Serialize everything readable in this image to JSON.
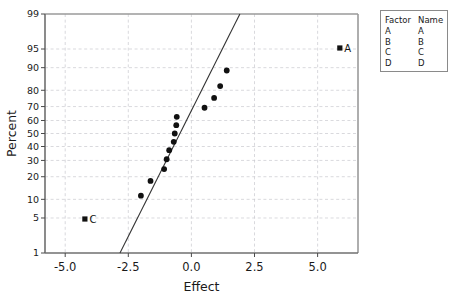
{
  "chart_data": {
    "type": "scatter",
    "title": "",
    "xlabel": "Effect",
    "ylabel": "Percent",
    "xlim": [
      -5.8,
      6.6
    ],
    "ylim": [
      1,
      99
    ],
    "grid": true,
    "yscale": "normal-probability",
    "xticks": [
      -5.0,
      -2.5,
      0.0,
      2.5,
      5.0
    ],
    "xtick_labels": [
      "-5.0",
      "-2.5",
      "0.0",
      "2.5",
      "5.0"
    ],
    "yticks": [
      1,
      5,
      10,
      20,
      30,
      40,
      50,
      60,
      70,
      80,
      90,
      95,
      99
    ],
    "ytick_labels": [
      "1",
      "5",
      "10",
      "20",
      "30",
      "40",
      "50",
      "60",
      "70",
      "80",
      "90",
      "95",
      "99"
    ],
    "series": [
      {
        "name": "Not Significant",
        "marker": "circle",
        "color": "#111111",
        "points": [
          {
            "x": -2.0,
            "y": 11.3
          },
          {
            "x": -1.62,
            "y": 17.8
          },
          {
            "x": -1.08,
            "y": 24.4
          },
          {
            "x": -0.98,
            "y": 30.8
          },
          {
            "x": -0.88,
            "y": 37.3
          },
          {
            "x": -0.7,
            "y": 43.6
          },
          {
            "x": -0.66,
            "y": 50.0
          },
          {
            "x": -0.6,
            "y": 56.4
          },
          {
            "x": -0.58,
            "y": 62.7
          },
          {
            "x": 0.52,
            "y": 69.2
          },
          {
            "x": 0.9,
            "y": 75.6
          },
          {
            "x": 1.14,
            "y": 82.2
          },
          {
            "x": 1.4,
            "y": 89.0
          }
        ]
      },
      {
        "name": "Significant",
        "marker": "square",
        "color": "#111111",
        "points": [
          {
            "x": -4.22,
            "y": 4.8,
            "label": "C"
          },
          {
            "x": 5.88,
            "y": 95.2,
            "label": "A"
          }
        ]
      }
    ],
    "fit_line": {
      "name": "reference-line",
      "color": "#333333",
      "x_start": -2.83,
      "y_start": 1,
      "x_end": 1.92,
      "y_end": 99
    },
    "annotations": [
      {
        "text": "A",
        "x": 5.88,
        "y": 95.2
      },
      {
        "text": "C",
        "x": -4.22,
        "y": 4.8
      }
    ]
  },
  "legend": {
    "headers": [
      "Factor",
      "Name"
    ],
    "rows": [
      {
        "factor": "A",
        "name": "A"
      },
      {
        "factor": "B",
        "name": "B"
      },
      {
        "factor": "C",
        "name": "C"
      },
      {
        "factor": "D",
        "name": "D"
      }
    ]
  }
}
